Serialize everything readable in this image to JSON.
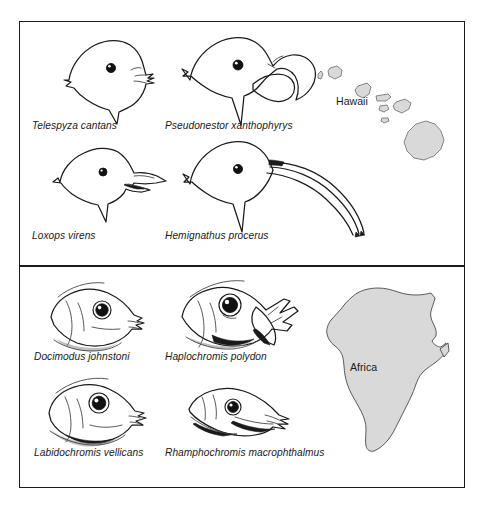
{
  "figure": {
    "background_color": "#ffffff",
    "ink_color": "#1a1a1a",
    "landmass_color": "#d9d9d9",
    "landmass_outline_color": "#4a4a4a"
  },
  "panels": [
    {
      "id": "hawaii",
      "map_label": "Hawaii",
      "map_name": "hawaiian-islands-map",
      "specimens": [
        {
          "caption": "Telespyza cantans",
          "name": "bird-head-telespyza-cantans",
          "beak": "short conical finch bill"
        },
        {
          "caption": "Pseudonestor xanthophyrys",
          "name": "bird-head-pseudonestor-xanthophyrys",
          "beak": "heavy hooked parrotbill"
        },
        {
          "caption": "Loxops virens",
          "name": "bird-head-loxops-virens",
          "beak": "slender decurved bill"
        },
        {
          "caption": "Hemignathus procerus",
          "name": "bird-head-hemignathus-procerus",
          "beak": "long sickle-shaped bill"
        }
      ]
    },
    {
      "id": "africa",
      "map_label": "Africa",
      "map_name": "africa-map",
      "specimens": [
        {
          "caption": "Docimodus johnstoni",
          "name": "fish-head-docimodus-johnstoni",
          "jaw": "small mouth, fin eater"
        },
        {
          "caption": "Haplochromis polydon",
          "name": "fish-head-haplochromis-polydon",
          "jaw": "wide gaping jaws, many teeth"
        },
        {
          "caption": "Labidochromis vellicans",
          "name": "fish-head-labidochromis-vellicans",
          "jaw": "forceps-like pincer mouth"
        },
        {
          "caption": "Rhamphochromis macrophthalmus",
          "name": "fish-head-rhamphochromis-macrophthalmus",
          "jaw": "elongate pike-like jaws"
        }
      ]
    }
  ]
}
